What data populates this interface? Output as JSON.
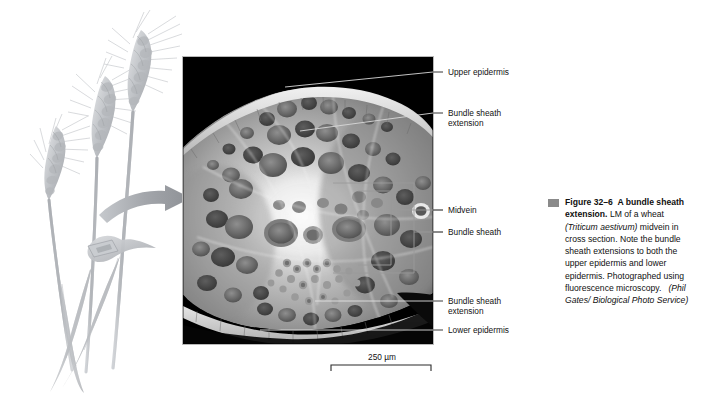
{
  "figure": {
    "plant_illustration_alt": "wheat-plant-three-ears",
    "arrow_alt": "curved-arrow-to-micrograph",
    "micrograph_alt": "fluorescence-light-micrograph-wheat-midvein-cross-section"
  },
  "callouts": [
    {
      "name": "upper-epidermis",
      "text": "Upper epidermis"
    },
    {
      "name": "bundle-sheath-extension-upper",
      "text": "Bundle sheath\nextension"
    },
    {
      "name": "midvein",
      "text": "Midvein"
    },
    {
      "name": "bundle-sheath",
      "text": "Bundle sheath"
    },
    {
      "name": "bundle-sheath-extension-lower",
      "text": "Bundle sheath\nextension"
    },
    {
      "name": "lower-epidermis",
      "text": "Lower epidermis"
    }
  ],
  "scale_bar": {
    "label": "250 µm"
  },
  "caption": {
    "figure_number": "Figure 32–6",
    "title": "A bundle sheath extension.",
    "body_1": "LM of a wheat ",
    "species": "(Triticum aestivum)",
    "body_2": " midvein in cross section. Note the bundle sheath extensions to both the upper epidermis and lower epidermis. Photographed using fluorescence microscopy.",
    "credit": "(Phil Gates/ Biological Photo Service)"
  },
  "colors": {
    "text": "#101010",
    "bullet": "#8a8a8a",
    "wheat": "#b9bcc0",
    "arrow": "#a8abaf",
    "leader": "#d8d8d8",
    "bracket": "#9a9a9a",
    "micrograph_bg": "#000000"
  }
}
